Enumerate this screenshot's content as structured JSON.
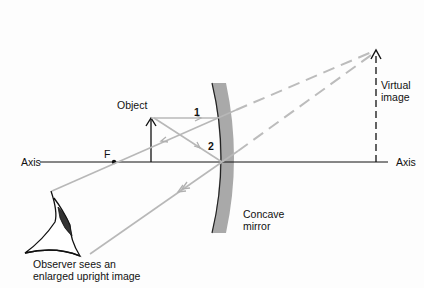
{
  "diagram": {
    "labels": {
      "object": "Object",
      "ray1": "1",
      "ray2": "2",
      "focal_point": "F",
      "axis_left": "Axis",
      "axis_right": "Axis",
      "virtual_image_line1": "Virtual",
      "virtual_image_line2": "image",
      "mirror_line1": "Concave",
      "mirror_line2": "mirror",
      "observer_line1": "Observer sees an",
      "observer_line2": "enlarged upright image"
    },
    "colors": {
      "line": "#111111",
      "ray": "#b8b8b8",
      "mirror": "#a9a9a9",
      "background": "#fdfdfd"
    }
  }
}
